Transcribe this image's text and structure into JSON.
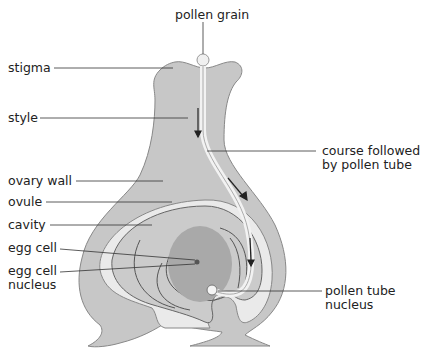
{
  "diagram": {
    "colors": {
      "ovary_wall": "#c7c7c7",
      "cavity": "#e9e9e9",
      "ovule": "#c9c9c9",
      "embryo_sac": "#a9a9a9",
      "outline": "#777777",
      "text": "#222222"
    },
    "labels": {
      "pollen_grain": "pollen grain",
      "stigma": "stigma",
      "style": "style",
      "course_line1": "course followed",
      "course_line2": "by pollen tube",
      "ovary_wall": "ovary wall",
      "ovule": "ovule",
      "cavity": "cavity",
      "egg_cell": "egg cell",
      "egg_nucleus_line1": "egg cell",
      "egg_nucleus_line2": "nucleus",
      "ptn_line1": "pollen tube",
      "ptn_line2": "nucleus"
    }
  }
}
